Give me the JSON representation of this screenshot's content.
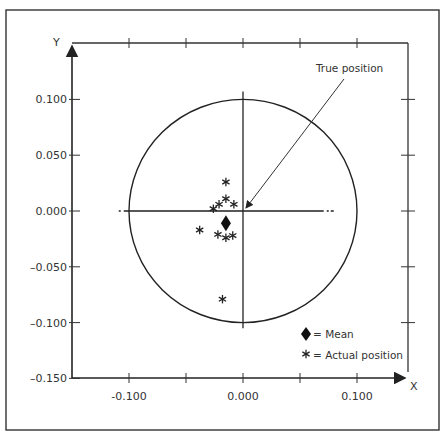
{
  "chart_data": {
    "type": "scatter",
    "title": "",
    "xlabel": "X",
    "ylabel": "Y",
    "xlim": [
      -0.15,
      0.15
    ],
    "ylim": [
      -0.15,
      0.12
    ],
    "grid": false,
    "x_ticks": [
      -0.15,
      -0.1,
      -0.05,
      0.0,
      0.05,
      0.1
    ],
    "x_tick_labels": [
      "-0.100",
      "0.000",
      "0.100"
    ],
    "x_tick_label_values": [
      -0.1,
      0.0,
      0.1
    ],
    "y_ticks": [
      0.1,
      0.05,
      0.0,
      -0.05,
      -0.1,
      -0.15
    ],
    "y_tick_labels": [
      "0.100",
      "0.050",
      "0.000",
      "–0.050",
      "–0.100",
      "–0.150"
    ],
    "circle": {
      "center": [
        0.0,
        0.0
      ],
      "radius": 0.1
    },
    "true_position": [
      0.0,
      0.0
    ],
    "series": [
      {
        "name": "Actual position",
        "marker": "asterisk",
        "points": [
          [
            -0.015,
            0.026
          ],
          [
            -0.026,
            0.002
          ],
          [
            -0.021,
            0.006
          ],
          [
            -0.015,
            0.011
          ],
          [
            -0.008,
            0.006
          ],
          [
            -0.038,
            -0.017
          ],
          [
            -0.022,
            -0.021
          ],
          [
            -0.015,
            -0.024
          ],
          [
            -0.009,
            -0.022
          ],
          [
            -0.018,
            -0.079
          ]
        ]
      },
      {
        "name": "Mean",
        "marker": "diamond",
        "points": [
          [
            -0.015,
            -0.011
          ]
        ]
      }
    ],
    "annotations": [
      {
        "text": "True position",
        "points_to": [
          0.0,
          0.0
        ]
      }
    ],
    "legend": {
      "placement": "bottom-right",
      "entries": [
        {
          "symbol": "◆",
          "text": "= Mean"
        },
        {
          "symbol": "∗",
          "text": "= Actual position"
        }
      ]
    }
  }
}
